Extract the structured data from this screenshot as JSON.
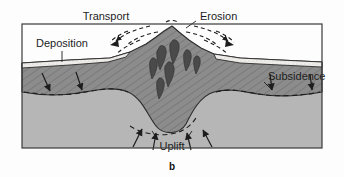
{
  "figure": {
    "caption": "b",
    "labels": {
      "transport": "Transport",
      "erosion": "Erosion",
      "deposition": "Deposition",
      "subsidence": "Subsidence",
      "uplift": "Uplift"
    }
  },
  "colors": {
    "crust": "#8c8c8c",
    "crust_dark": "#7f7f7f",
    "mantle": "#b6b6b6",
    "sediment": "#f2f0ec",
    "pluton": "#4a4a4a",
    "outline": "#2b2b2b",
    "background": "#fdfdfd",
    "hatch": "#6d6d6d",
    "text": "#1d1d1d"
  },
  "diagram_data": {
    "type": "cross-section",
    "subject": "Isostatic adjustment of a mountain belt",
    "layers": [
      {
        "name": "sediment-wedge",
        "position": "surface of flanking basins",
        "fill": "#f2f0ec"
      },
      {
        "name": "crust",
        "position": "upper block with mountain and root",
        "fill": "#8c8c8c",
        "texture": "diagonal-hatch"
      },
      {
        "name": "mantle",
        "position": "below crustal root",
        "fill": "#b6b6b6",
        "texture": "plain"
      }
    ],
    "features": [
      {
        "name": "mountain-peak",
        "x": 172,
        "y": 36
      },
      {
        "name": "crustal-root",
        "x": 172,
        "y": 128
      },
      {
        "name": "plutons",
        "count": 7
      }
    ],
    "processes": [
      {
        "label": "Transport",
        "arrows": 2,
        "direction": "outward-from-peak",
        "style": "dashed-curved"
      },
      {
        "label": "Erosion",
        "arrows": 2,
        "direction": "down-slope",
        "style": "dashed-curved"
      },
      {
        "label": "Deposition",
        "arrows": 0,
        "direction": "leader-to-sediment-wedge",
        "style": "leader-line"
      },
      {
        "label": "Subsidence",
        "arrows": 2,
        "direction": "downward",
        "style": "solid-arrow"
      },
      {
        "label": "Uplift",
        "arrows": 4,
        "direction": "upward",
        "style": "solid-arrow"
      }
    ]
  }
}
